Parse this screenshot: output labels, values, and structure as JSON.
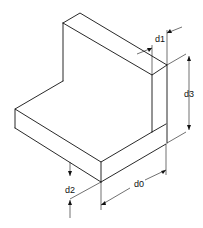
{
  "diagram": {
    "type": "isometric-technical-drawing",
    "line_color": "#111111",
    "background": "#ffffff",
    "dimensions": [
      {
        "id": "d0",
        "label": "d0",
        "meaning": "base depth"
      },
      {
        "id": "d1",
        "label": "d1",
        "meaning": "vertical plate thickness"
      },
      {
        "id": "d2",
        "label": "d2",
        "meaning": "base thickness"
      },
      {
        "id": "d3",
        "label": "d3",
        "meaning": "vertical plate height above base"
      }
    ]
  }
}
